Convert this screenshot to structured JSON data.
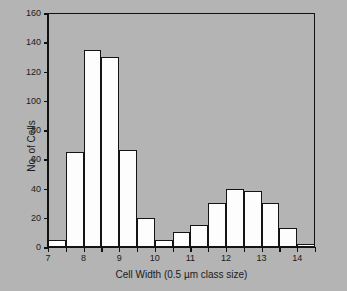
{
  "chart_data": {
    "type": "bar",
    "title": "",
    "xlabel": "Cell Width (0.5 µm class size)",
    "ylabel": "No. of Cells",
    "xlim": [
      7,
      14.5
    ],
    "ylim": [
      0,
      160
    ],
    "grid": false,
    "legend": null,
    "class_size": 0.5,
    "bin_edges": [
      7,
      7.5,
      8,
      8.5,
      9,
      9.5,
      10,
      10.5,
      11,
      11.5,
      12,
      12.5,
      13,
      13.5,
      14,
      14.5
    ],
    "bin_left_edges": [
      7,
      7.5,
      8,
      8.5,
      9,
      9.5,
      10,
      10.5,
      11,
      11.5,
      12,
      12.5,
      13,
      13.5,
      14
    ],
    "values": [
      5,
      65,
      135,
      130,
      66,
      20,
      5,
      10,
      15,
      30,
      40,
      38,
      30,
      13,
      2
    ],
    "y_ticks": [
      0,
      20,
      40,
      60,
      80,
      100,
      120,
      140,
      160
    ],
    "y_tick_labels": [
      "0",
      "20",
      "40",
      "60",
      "80",
      "100",
      "120",
      "140",
      "160"
    ],
    "x_ticks": [
      7,
      7.5,
      8,
      8.5,
      9,
      9.5,
      10,
      10.5,
      11,
      11.5,
      12,
      12.5,
      13,
      13.5,
      14,
      14.5
    ],
    "x_tick_labels": [
      "7",
      "8",
      "9",
      "10",
      "11",
      "12",
      "13",
      "14"
    ],
    "x_labeled_ticks": [
      7,
      8,
      9,
      10,
      11,
      12,
      13,
      14
    ],
    "colors": {
      "background": "#b4b4b4",
      "bar_fill": "#fdfdfd",
      "bar_edge": "#141414",
      "axis": "#111111",
      "text": "#1a1a1a"
    }
  }
}
